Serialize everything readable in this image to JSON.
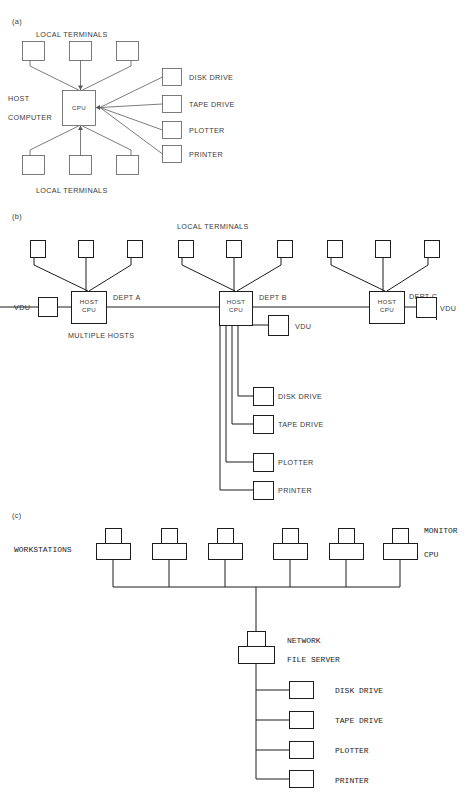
{
  "figure": {
    "caption_fragment": "",
    "sections": [
      {
        "id": "a",
        "label": "(a)"
      },
      {
        "id": "b",
        "label": "(b)"
      },
      {
        "id": "c",
        "label": "(c)"
      }
    ]
  },
  "section_a": {
    "title": "(a)",
    "terminals_top_label": "LOCAL  TERMINALS",
    "terminals_bottom_label": "LOCAL  TERMINALS",
    "host_line1": "HOST",
    "host_line2": "COMPUTER",
    "cpu_label": "CPU",
    "peripherals": [
      {
        "name": "DISK  DRIVE"
      },
      {
        "name": "TAPE  DRIVE"
      },
      {
        "name": "PLOTTER"
      },
      {
        "name": "PRINTER"
      }
    ],
    "terminal_count_top": 3,
    "terminal_count_bottom": 3
  },
  "section_b": {
    "title": "(b)",
    "terminals_label": "LOCAL  TERMINALS",
    "multiple_hosts_label": "MULTIPLE    HOSTS",
    "hosts": [
      {
        "dept": "DEPT  A",
        "cpu_line1": "HOST",
        "cpu_line2": "CPU",
        "vdu_label": "VDU",
        "vdu_side": "left",
        "terminals": 3
      },
      {
        "dept": "DEPT  B",
        "cpu_line1": "HOST",
        "cpu_line2": "CPU",
        "vdu_label": "VDU",
        "vdu_side": "right",
        "terminals": 3
      },
      {
        "dept": "DEPT  C",
        "cpu_line1": "HOST",
        "cpu_line2": "CPU",
        "vdu_label": "VDU",
        "vdu_side": "right",
        "terminals": 3
      }
    ],
    "peripherals": [
      {
        "name": "DISK  DRIVE"
      },
      {
        "name": "TAPE  DRIVE"
      },
      {
        "name": "PLOTTER"
      },
      {
        "name": "PRINTER"
      }
    ]
  },
  "section_c": {
    "title": "(c)",
    "workstations_label": "WORKSTATIONS",
    "monitor_label": "MONITOR",
    "cpu_label": "CPU",
    "server_line1": "NETWORK",
    "server_line2": "FILE SERVER",
    "workstation_count": 6,
    "peripherals": [
      {
        "name": "DISK DRIVE"
      },
      {
        "name": "TAPE DRIVE"
      },
      {
        "name": "PLOTTER"
      },
      {
        "name": "PRINTER"
      }
    ]
  }
}
